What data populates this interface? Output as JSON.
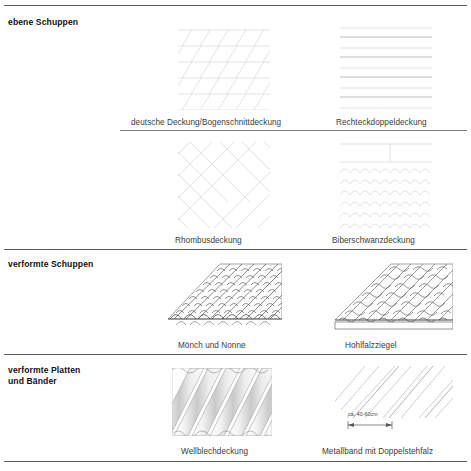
{
  "document": {
    "title": "Dacheindeckungen – Übersicht",
    "language": "de"
  },
  "rows": [
    {
      "id": "ebene-schuppen",
      "category_label": "ebene Schuppen",
      "cells": [
        {
          "id": "deutsche-deckung",
          "caption": "deutsche Deckung/Bogenschnittdeckung",
          "pattern": "diagonal-slate-grid"
        },
        {
          "id": "rechteckdoppeldeckung",
          "caption": "Rechteckdoppeldeckung",
          "pattern": "horizontal-courses"
        }
      ]
    },
    {
      "id": "ebene-schuppen-2",
      "category_label": "",
      "cells": [
        {
          "id": "rhombusdeckung",
          "caption": "Rhombusdeckung",
          "pattern": "rhombus-grid"
        },
        {
          "id": "biberschwanzdeckung",
          "caption": "Biberschwanzdeckung",
          "pattern": "scalloped-courses"
        }
      ]
    },
    {
      "id": "verformte-schuppen",
      "category_label": "verformte Schuppen",
      "cells": [
        {
          "id": "moench-und-nonne",
          "caption": "Mönch und Nonne",
          "pattern": "barrel-tiles-perspective"
        },
        {
          "id": "hohlfalzziegel",
          "caption": "Hohlfalzziegel",
          "pattern": "pantile-perspective"
        }
      ]
    },
    {
      "id": "verformte-platten-und-baender",
      "category_label_line1": "verformte Platten",
      "category_label_line2": "und Bänder",
      "cells": [
        {
          "id": "wellblechdeckung",
          "caption": "Wellblechdeckung",
          "pattern": "corrugated-sheet"
        },
        {
          "id": "metallband-doppelstehfalz",
          "caption": "Metallband mit Doppelstehfalz",
          "pattern": "standing-seam-strips",
          "dimension_label": "ca. 40-60cm"
        }
      ]
    }
  ],
  "colors": {
    "rule": "#6f6f6f",
    "faint_line": "#d8d8d8",
    "line": "#5a5a5a",
    "caption": "#3b3b3b",
    "label": "#111111"
  }
}
